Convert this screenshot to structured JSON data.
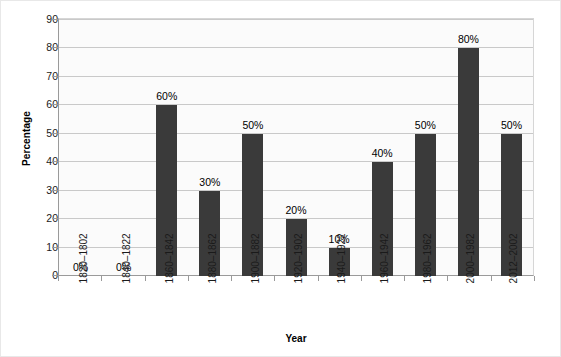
{
  "chart_data": {
    "type": "bar",
    "title": "",
    "subtitle": "",
    "xlabel": "Year",
    "ylabel": "Percentage",
    "categories": [
      "1802–1820",
      "1822–1840",
      "1842–1860",
      "1862–1880",
      "1882–1900",
      "1902–1920",
      "1922–1940",
      "1942–1960",
      "1962–1980",
      "1982–2000",
      "2002–2012"
    ],
    "values": [
      0,
      0,
      60,
      30,
      50,
      20,
      10,
      40,
      50,
      80,
      50
    ],
    "data_labels": [
      "0%",
      "0%",
      "60%",
      "30%",
      "50%",
      "20%",
      "10%",
      "40%",
      "50%",
      "80%",
      "50%"
    ],
    "ylim": [
      0,
      90
    ],
    "ytick_values": [
      0,
      10,
      20,
      30,
      40,
      50,
      60,
      70,
      80,
      90
    ],
    "ytick_labels": [
      "0",
      "10",
      "20",
      "30",
      "40",
      "50",
      "60",
      "70",
      "80",
      "90"
    ],
    "grid": "horizontal",
    "legend": "none",
    "bar_color": "#3a3a3a",
    "plot_background": "#fbfbfb",
    "gridline_color": "#c9c9c9",
    "axis_color": "#9a9a9a",
    "figure_background": "#ffffff",
    "figure_border_color": "#e8e8e8"
  }
}
